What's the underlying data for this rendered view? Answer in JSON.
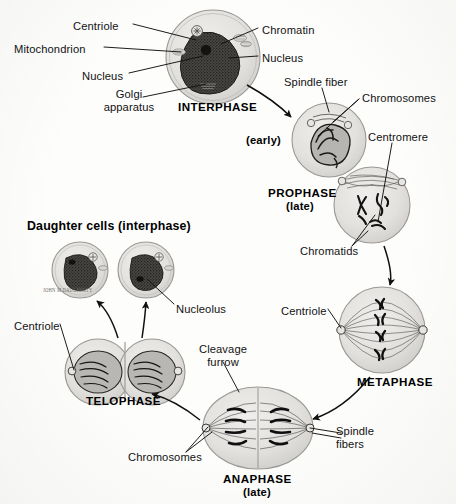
{
  "figure": {
    "background_color": "#fdfdfc",
    "ink_color": "#141414",
    "artist_signature": "JOHN M DAUGHERTY"
  },
  "headings": {
    "daughter_cells": "Daughter cells (interphase)"
  },
  "stages": [
    {
      "id": "interphase",
      "name": "INTERPHASE",
      "qualifier": "",
      "cx": 213,
      "cy": 57,
      "r": 47
    },
    {
      "id": "prophase_early",
      "name": "",
      "qualifier": "(early)",
      "cx": 329,
      "cy": 140,
      "r": 37
    },
    {
      "id": "prophase_late",
      "name": "PROPHASE",
      "qualifier": "(late)",
      "cx": 372,
      "cy": 205,
      "r": 38
    },
    {
      "id": "metaphase",
      "name": "METAPHASE",
      "qualifier": "",
      "cx": 382,
      "cy": 330,
      "r": 43
    },
    {
      "id": "anaphase",
      "name": "ANAPHASE",
      "qualifier": "(late)",
      "cx": 258,
      "cy": 428,
      "r": 43
    },
    {
      "id": "telophase",
      "name": "TELOPHASE",
      "qualifier": "",
      "cx": 124,
      "cy": 372,
      "r": 38
    },
    {
      "id": "daughter_cells",
      "name": "",
      "qualifier": "",
      "cx": 80,
      "cy": 270,
      "r": 28
    }
  ],
  "stage_labels": [
    {
      "name": "stage-label-interphase",
      "text": "INTERPHASE",
      "x": 178,
      "y": 100,
      "align": "left"
    },
    {
      "name": "stage-label-prophase-early",
      "text": "(early)",
      "x": 246,
      "y": 134,
      "align": "left"
    },
    {
      "name": "stage-label-prophase",
      "text": "PROPHASE",
      "x": 268,
      "y": 186,
      "align": "left"
    },
    {
      "name": "stage-label-prophase-late",
      "text": "(late)",
      "x": 286,
      "y": 200,
      "align": "left"
    },
    {
      "name": "stage-label-metaphase",
      "text": "METAPHASE",
      "x": 357,
      "y": 375,
      "align": "left"
    },
    {
      "name": "stage-label-anaphase",
      "text": "ANAPHASE",
      "x": 223,
      "y": 472,
      "align": "left"
    },
    {
      "name": "stage-label-anaphase-late",
      "text": "(late)",
      "x": 243,
      "y": 486,
      "align": "left"
    },
    {
      "name": "stage-label-telophase",
      "text": "TELOPHASE",
      "x": 86,
      "y": 394,
      "align": "left"
    }
  ],
  "callouts": [
    {
      "name": "callout-centriole-interphase",
      "text": "Centriole",
      "x": 73,
      "y": 20,
      "align": "left"
    },
    {
      "name": "callout-chromatin",
      "text": "Chromatin",
      "x": 262,
      "y": 24,
      "align": "left"
    },
    {
      "name": "callout-mitochondrion",
      "text": "Mitochondrion",
      "x": 14,
      "y": 43,
      "align": "left"
    },
    {
      "name": "callout-nucleus-right",
      "text": "Nucleus",
      "x": 262,
      "y": 52,
      "align": "left"
    },
    {
      "name": "callout-nucleus-left",
      "text": "Nucleus",
      "x": 82,
      "y": 70,
      "align": "left"
    },
    {
      "name": "callout-golgi-apparatus",
      "text": "Golgi\napparatus",
      "x": 112,
      "y": 88,
      "align": "left"
    },
    {
      "name": "callout-spindle-fiber",
      "text": "Spindle fiber",
      "x": 284,
      "y": 76,
      "align": "left"
    },
    {
      "name": "callout-chromosomes-prophase",
      "text": "Chromosomes",
      "x": 362,
      "y": 92,
      "align": "left"
    },
    {
      "name": "callout-centromere",
      "text": "Centromere",
      "x": 368,
      "y": 131,
      "align": "left"
    },
    {
      "name": "callout-chromatids",
      "text": "Chromatids",
      "x": 300,
      "y": 245,
      "align": "left"
    },
    {
      "name": "callout-centriole-metaphase",
      "text": "Centriole",
      "x": 281,
      "y": 305,
      "align": "left"
    },
    {
      "name": "callout-cleavage-furrow",
      "text": "Cleavage\nfurrow",
      "x": 197,
      "y": 343,
      "align": "left"
    },
    {
      "name": "callout-spindle-fibers",
      "text": "Spindle\nfibers",
      "x": 336,
      "y": 425,
      "align": "left"
    },
    {
      "name": "callout-chromosomes-anaphase",
      "text": "Chromosomes",
      "x": 128,
      "y": 451,
      "align": "left"
    },
    {
      "name": "callout-nucleolus",
      "text": "Nucleolus",
      "x": 176,
      "y": 303,
      "align": "left"
    },
    {
      "name": "callout-centriole-telophase",
      "text": "Centriole",
      "x": 14,
      "y": 320,
      "align": "left"
    }
  ],
  "arrows": [
    {
      "name": "arrow-interphase-to-prophase",
      "from": "interphase",
      "to": "prophase_early"
    },
    {
      "name": "arrow-prophase-to-metaphase",
      "from": "prophase_late",
      "to": "metaphase"
    },
    {
      "name": "arrow-metaphase-to-anaphase",
      "from": "metaphase",
      "to": "anaphase"
    },
    {
      "name": "arrow-anaphase-to-telophase",
      "from": "anaphase",
      "to": "telophase"
    },
    {
      "name": "arrow-telophase-to-daughter",
      "from": "telophase",
      "to": "daughter_cells"
    }
  ]
}
